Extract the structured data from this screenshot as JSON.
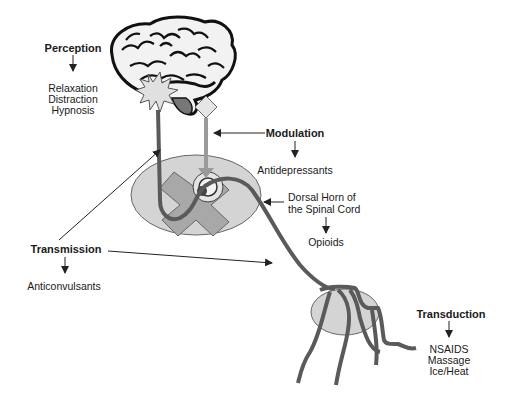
{
  "stages": {
    "perception": {
      "title": "Perception",
      "interventions": [
        "Relaxation",
        "Distraction",
        "Hypnosis"
      ]
    },
    "modulation": {
      "title": "Modulation",
      "interventions": [
        "Antidepressants"
      ]
    },
    "dorsal_horn": {
      "line1": "Dorsal Horn of",
      "line2": "the Spinal Cord",
      "interventions": [
        "Opioids"
      ]
    },
    "transmission": {
      "title": "Transmission",
      "interventions": [
        "Anticonvulsants"
      ]
    },
    "transduction": {
      "title": "Transduction",
      "interventions": [
        "NSAIDS",
        "Massage",
        "Ice/Heat"
      ]
    }
  },
  "colors": {
    "nerve_dark": "#5a5a5a",
    "nerve_light": "#9a9a9a",
    "oval_fill": "#d4d4d4",
    "cross_fill": "#a8a8a8",
    "starburst_fill": "#e0e0e0"
  }
}
